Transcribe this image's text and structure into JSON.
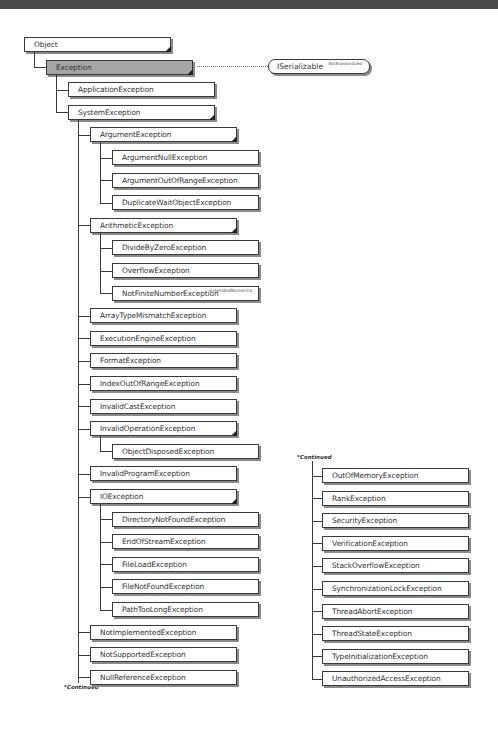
{
  "diagram": {
    "interface": {
      "label": "ISerializable",
      "tag": "NotStandardized"
    },
    "continued_label": "*Continued",
    "nodes": [
      {
        "label": "Object",
        "level": 0,
        "abstract": true
      },
      {
        "label": "Exception",
        "level": 1,
        "root": true,
        "abstract": true
      },
      {
        "label": "ApplicationException",
        "level": 2
      },
      {
        "label": "SystemException",
        "level": 2,
        "abstract": true
      },
      {
        "label": "ArgumentException",
        "level": 3,
        "abstract": true
      },
      {
        "label": "ArgumentNullException",
        "level": 4
      },
      {
        "label": "ArgumentOutOfRangeException",
        "level": 4
      },
      {
        "label": "DuplicateWaitObjectException",
        "level": 4
      },
      {
        "label": "ArithmeticException",
        "level": 3,
        "abstract": true
      },
      {
        "label": "DivideByZeroException",
        "level": 4
      },
      {
        "label": "OverflowException",
        "level": 4
      },
      {
        "label": "NotFiniteNumberException",
        "level": 4,
        "tag": "ExtendedNumerics"
      },
      {
        "label": "ArrayTypeMismatchException",
        "level": 3
      },
      {
        "label": "ExecutionEngineException",
        "level": 3
      },
      {
        "label": "FormatException",
        "level": 3
      },
      {
        "label": "IndexOutOfRangeException",
        "level": 3
      },
      {
        "label": "InvalidCastException",
        "level": 3
      },
      {
        "label": "InvalidOperationException",
        "level": 3,
        "abstract": true
      },
      {
        "label": "ObjectDisposedException",
        "level": 4
      },
      {
        "label": "InvalidProgramException",
        "level": 3
      },
      {
        "label": "IOException",
        "level": 3,
        "abstract": true
      },
      {
        "label": "DirectoryNotFoundException",
        "level": 4
      },
      {
        "label": "EndOfStreamException",
        "level": 4
      },
      {
        "label": "FileLoadException",
        "level": 4
      },
      {
        "label": "FileNotFoundException",
        "level": 4
      },
      {
        "label": "PathTooLongException",
        "level": 4
      },
      {
        "label": "NotImplementedException",
        "level": 3
      },
      {
        "label": "NotSupportedException",
        "level": 3
      },
      {
        "label": "NullReferenceException",
        "level": 3
      }
    ],
    "continued_nodes": [
      {
        "label": "OutOfMemoryException"
      },
      {
        "label": "RankException"
      },
      {
        "label": "SecurityException"
      },
      {
        "label": "VerificationException"
      },
      {
        "label": "StackOverflowException"
      },
      {
        "label": "SynchronizationLockException"
      },
      {
        "label": "ThreadAbortException"
      },
      {
        "label": "ThreadStateException"
      },
      {
        "label": "TypeInitializationException"
      },
      {
        "label": "UnauthorizedAccessException"
      }
    ]
  }
}
